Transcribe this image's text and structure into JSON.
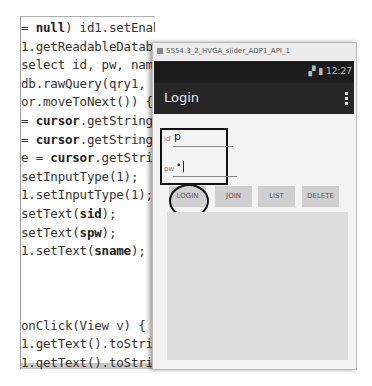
{
  "code_editor": {
    "lines": [
      {
        "pre": "= ",
        "bold": "null",
        "post": ") id1.setEnabled(false);"
      },
      {
        "pre": "1.getReadableDatabase()",
        "bold": "",
        "post": ""
      },
      {
        "pre": "select id, pw, name f",
        "bold": "",
        "post": ""
      },
      {
        "pre": " db.rawQuery(qry1, nul",
        "bold": "",
        "post": ""
      },
      {
        "pre": "or.moveToNext()) {",
        "bold": "",
        "post": ""
      },
      {
        "pre": "= ",
        "bold": "cursor",
        "post": ".getString(0);"
      },
      {
        "pre": "= ",
        "bold": "cursor",
        "post": ".getString(1);"
      },
      {
        "pre": "e = ",
        "bold": "cursor",
        "post": ".getString(2)"
      },
      {
        "pre": "setInputType(1);",
        "bold": "",
        "post": ""
      },
      {
        "pre": "1.setInputType(1);",
        "bold": "",
        "post": ""
      },
      {
        "pre": "setText(",
        "bold": "sid",
        "post": ");"
      },
      {
        "pre": "setText(",
        "bold": "spw",
        "post": ");"
      },
      {
        "pre": "1.setText(",
        "bold": "sname",
        "post": ");"
      },
      {
        "pre": "",
        "bold": "",
        "post": ""
      },
      {
        "pre": "",
        "bold": "",
        "post": ""
      },
      {
        "pre": "",
        "bold": "",
        "post": ""
      },
      {
        "pre": "onClick(View v) {",
        "bold": "",
        "post": ""
      },
      {
        "pre": "1.getText().toString();",
        "bold": "",
        "post": ""
      },
      {
        "pre": "1.getText().toString()",
        "bold": "",
        "post": ""
      }
    ]
  },
  "emulator": {
    "window_title": "5554:3_2_HVGA_slider_ADP1_API_1",
    "status_bar": {
      "signal": "3G",
      "time": "12:27"
    },
    "action_bar": {
      "title": "Login",
      "overflow_icon": "vertical-dots"
    },
    "form": {
      "id_label": "id",
      "id_value": "p",
      "pw_label": "pw",
      "pw_value": "•"
    },
    "buttons": [
      {
        "label": "LOGIN",
        "highlighted": true
      },
      {
        "label": "JOIN"
      },
      {
        "label": "LIST"
      },
      {
        "label": "DELETE"
      }
    ]
  },
  "colors": {
    "action_bar": "#262626",
    "status_bar": "#1c1c1c",
    "button_bg": "#cfcfcf",
    "list_bg": "#dcdcdc",
    "annotation": "#111111"
  }
}
